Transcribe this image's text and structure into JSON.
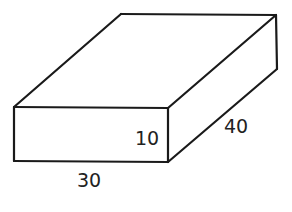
{
  "diagram": {
    "type": "rectangular-prism",
    "stroke_color": "#1a1a1a",
    "background": "#ffffff",
    "dimensions": {
      "length": {
        "label": "30",
        "edge": "front-bottom"
      },
      "height": {
        "label": "10",
        "edge": "front-right-vertical"
      },
      "depth": {
        "label": "40",
        "edge": "right-receding"
      }
    }
  }
}
